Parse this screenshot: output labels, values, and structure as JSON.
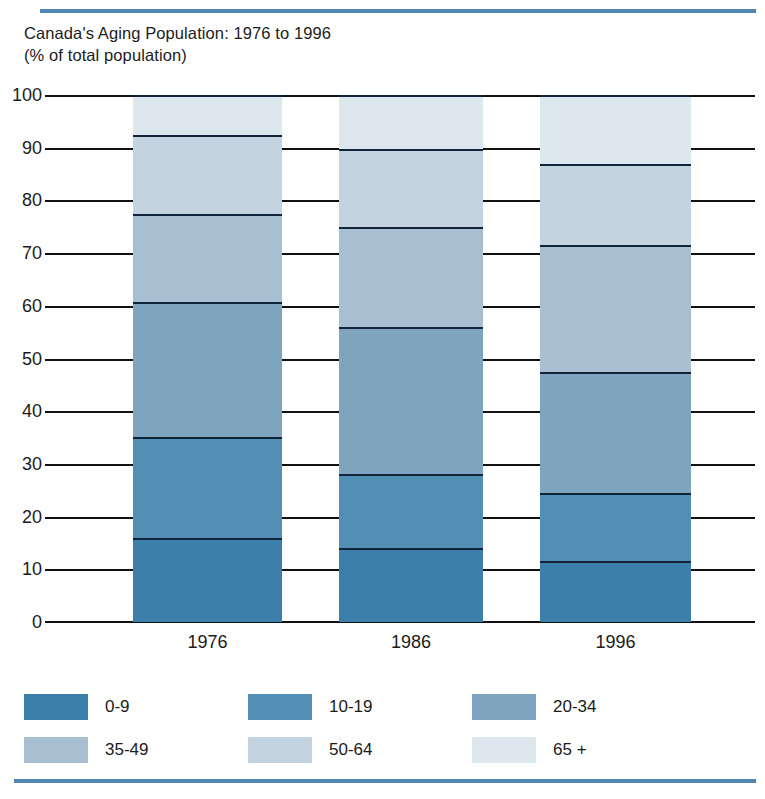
{
  "title": {
    "line1": "Canada's Aging Population: 1976 to 1996",
    "line2": "(% of total population)"
  },
  "colors": {
    "rule": "#4f86b4",
    "divider": "#10253c",
    "age_0_9": "#3d7fab",
    "age_10_19": "#538eb4",
    "age_20_34": "#7fa4c0",
    "age_35_49": "#a8bfd2",
    "age_50_64": "#c3d4e0",
    "age_65_plus": "#dde8ee"
  },
  "axis": {
    "y_ticks": [
      "100",
      "90",
      "80",
      "70",
      "60",
      "50",
      "40",
      "30",
      "20",
      "10",
      "0"
    ],
    "y_min": 0,
    "y_max": 100,
    "x_categories": [
      "1976",
      "1986",
      "1996"
    ]
  },
  "legend": {
    "items": [
      {
        "label": "0-9",
        "color": "#3d7fab"
      },
      {
        "label": "10-19",
        "color": "#538eb4"
      },
      {
        "label": "20-34",
        "color": "#7fa4c0"
      },
      {
        "label": "35-49",
        "color": "#a8bfd2"
      },
      {
        "label": "50-64",
        "color": "#c3d4e0"
      },
      {
        "label": "65 +",
        "color": "#dde8ee"
      }
    ]
  },
  "chart_data": {
    "type": "bar",
    "stacked": true,
    "title": "Canada's Aging Population: 1976 to 1996 (% of total population)",
    "xlabel": "",
    "ylabel": "% of total population",
    "ylim": [
      0,
      100
    ],
    "ytick_step": 10,
    "grid": true,
    "legend_position": "bottom",
    "categories": [
      "1976",
      "1986",
      "1996"
    ],
    "series": [
      {
        "name": "0-9",
        "color": "#3d7fab",
        "values": [
          15.9,
          14.0,
          11.5
        ]
      },
      {
        "name": "10-19",
        "color": "#538eb4",
        "values": [
          19.2,
          14.0,
          13.0
        ]
      },
      {
        "name": "20-34",
        "color": "#7fa4c0",
        "values": [
          25.6,
          28.0,
          23.0
        ]
      },
      {
        "name": "35-49",
        "color": "#a8bfd2",
        "values": [
          16.7,
          19.0,
          24.0
        ]
      },
      {
        "name": "50-64",
        "color": "#c3d4e0",
        "values": [
          15.1,
          14.8,
          15.5
        ]
      },
      {
        "name": "65 +",
        "color": "#dde8ee",
        "values": [
          7.5,
          10.2,
          13.0
        ]
      }
    ],
    "stack_tops": {
      "1976": [
        15.9,
        35.1,
        60.7,
        77.4,
        92.5,
        100.0
      ],
      "1986": [
        14.0,
        28.0,
        56.0,
        75.0,
        89.8,
        100.0
      ],
      "1996": [
        11.5,
        24.5,
        47.5,
        71.5,
        87.0,
        100.0
      ]
    }
  }
}
